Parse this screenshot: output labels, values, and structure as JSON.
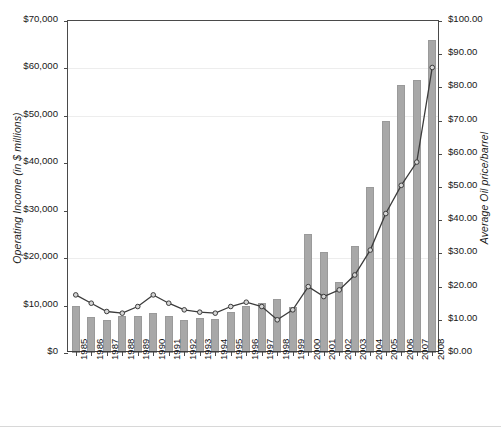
{
  "chart_data": {
    "type": "bar",
    "title": "",
    "subtitle": "",
    "categories": [
      "1985",
      "1986",
      "1987",
      "1988",
      "1989",
      "1990",
      "1991",
      "1992",
      "1993",
      "1994",
      "1995",
      "1996",
      "1997",
      "1998",
      "1999",
      "2000",
      "2001",
      "2002",
      "2003",
      "2004",
      "2005",
      "2006",
      "2007",
      "2008"
    ],
    "xlabel": "",
    "ylabel": "Operating Income (in $ millions)",
    "y2label": "Average Oil price/barrel",
    "ylim": [
      0,
      70000
    ],
    "y2lim": [
      0,
      100
    ],
    "ytick_labels": [
      "$0",
      "$10,000",
      "$20,000",
      "$30,000",
      "$40,000",
      "$50,000",
      "$60,000",
      "$70,000"
    ],
    "ytick_values": [
      0,
      10000,
      20000,
      30000,
      40000,
      50000,
      60000,
      70000
    ],
    "y2tick_labels": [
      "$0.00",
      "$10.00",
      "$20.00",
      "$30.00",
      "$40.00",
      "$50.00",
      "$60.00",
      "$70.00",
      "$80.00",
      "$90.00",
      "$100.00"
    ],
    "y2tick_values": [
      0,
      10,
      20,
      30,
      40,
      50,
      60,
      70,
      80,
      90,
      100
    ],
    "grid": true,
    "legend": "none",
    "series": [
      {
        "name": "Operating Income (in $ millions)",
        "type": "bar",
        "axis": "left",
        "color": "#a8a8a8",
        "values": [
          10000,
          7500,
          7000,
          7900,
          7800,
          8500,
          7900,
          6900,
          7300,
          7100,
          8600,
          9900,
          10500,
          11400,
          9600,
          25000,
          21300,
          15000,
          22600,
          35000,
          48900,
          56600,
          57500,
          66000
        ]
      },
      {
        "name": "Average Oil price/barrel",
        "type": "line",
        "axis": "right",
        "color": "#3c3c3c",
        "marker": "circle",
        "values": [
          17.5,
          15.0,
          12.5,
          12.0,
          14.0,
          17.5,
          15.0,
          13.0,
          12.3,
          12.0,
          14.0,
          15.3,
          14.0,
          10.0,
          13.0,
          20.0,
          17.0,
          19.0,
          23.5,
          31.0,
          42.0,
          50.5,
          57.5,
          86.0
        ]
      }
    ]
  }
}
